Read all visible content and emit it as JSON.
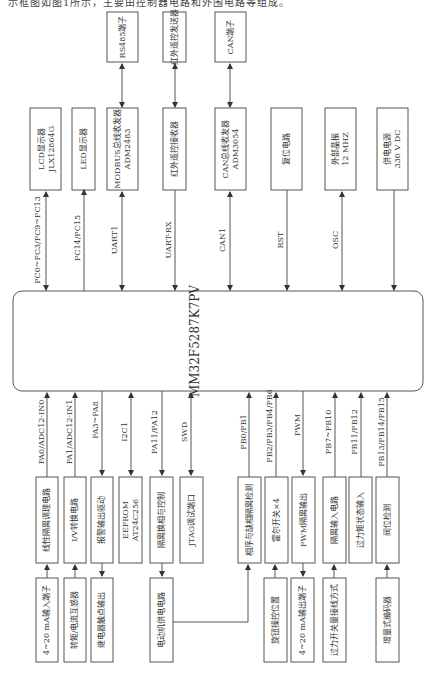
{
  "caption": "示框图如图1所示，主要由控制器电路和外围电路等组成。",
  "mcu": {
    "label": "MM32F5287K7PV"
  },
  "top_row_outer": [
    {
      "id": "rs485",
      "label": "RS485端子"
    },
    {
      "id": "ir_tx",
      "label": "红外遥控发送器"
    },
    {
      "id": "can_port",
      "label": "CAN端子"
    }
  ],
  "top_row_inner": [
    {
      "id": "lcd",
      "lines": [
        "LCD显示器",
        "JLX12864G"
      ],
      "signal": "PC0~PC3/PC9~PC13"
    },
    {
      "id": "led",
      "lines": [
        "LED显示器"
      ],
      "signal": "PC14/PC15"
    },
    {
      "id": "modbus",
      "lines": [
        "MODBUS总线收发器",
        "ADM2483"
      ],
      "signal": "UART1"
    },
    {
      "id": "ir_rx",
      "lines": [
        "红外遥控接收器"
      ],
      "signal": "UART-RX"
    },
    {
      "id": "can",
      "lines": [
        "CAN总线收发器",
        "ADM3054"
      ],
      "signal": "CAN1"
    },
    {
      "id": "reset",
      "lines": [
        "复位电路"
      ],
      "signal": "RST"
    },
    {
      "id": "osc",
      "lines": [
        "外部晶振",
        "12 MHZ"
      ],
      "signal": "OSC"
    },
    {
      "id": "power",
      "lines": [
        "供电电源",
        "330 V DC"
      ],
      "signal": ""
    }
  ],
  "bottom_row_inner": [
    {
      "id": "linear_iso",
      "lines": [
        "线性隔离调理电路"
      ],
      "signal": "PA0/ADC12-IN0"
    },
    {
      "id": "iv_conv",
      "lines": [
        "I/V转换电路"
      ],
      "signal": "PA1/ADC12-IN1"
    },
    {
      "id": "alarm_drv",
      "lines": [
        "报警输出驱动"
      ],
      "signal": "PA3~PA8"
    },
    {
      "id": "eeprom",
      "lines": [
        "EEPROM",
        "AT24C256"
      ],
      "signal": "I2C1"
    },
    {
      "id": "iso_phase",
      "lines": [
        "隔离换相与控制"
      ],
      "signal": "PA11/PA12"
    },
    {
      "id": "jtag",
      "lines": [
        "JTAG调试端口"
      ],
      "signal": "SWD"
    },
    {
      "id": "phase_detect",
      "lines": [
        "相序与缺相隔离检测"
      ],
      "signal": "PB0/PB1"
    },
    {
      "id": "hall",
      "lines": [
        "霍尔开关×4"
      ],
      "signal": "PB2/PB3/PB4/PB6"
    },
    {
      "id": "pwm_iso",
      "lines": [
        "PWM隔离输出"
      ],
      "signal": "PWM"
    },
    {
      "id": "iso_input",
      "lines": [
        "隔离输入电路"
      ],
      "signal": "PB7~PB10"
    },
    {
      "id": "torque_state",
      "lines": [
        "过力矩状态输入"
      ],
      "signal": "PB11/PB12"
    },
    {
      "id": "valve_pos",
      "lines": [
        "阀位检测"
      ],
      "signal": "PB13/PB14/PB15"
    }
  ],
  "bottom_row_outer": [
    {
      "id": "ma_in",
      "label": "4~20 mA输入端子"
    },
    {
      "id": "torque_sensor",
      "label": "转矩/电流互感器"
    },
    {
      "id": "relay_out",
      "label": "继电器触点输出"
    },
    {
      "id": "motor_power",
      "label": "电动机供电电路"
    },
    {
      "id": "knob",
      "label": "旋钮操控位置"
    },
    {
      "id": "ma_out",
      "label": "4~20 mA输出端子"
    },
    {
      "id": "torque_switch",
      "label": "过力开关量接线方式"
    },
    {
      "id": "encoder",
      "label": "增量式编码器"
    }
  ]
}
